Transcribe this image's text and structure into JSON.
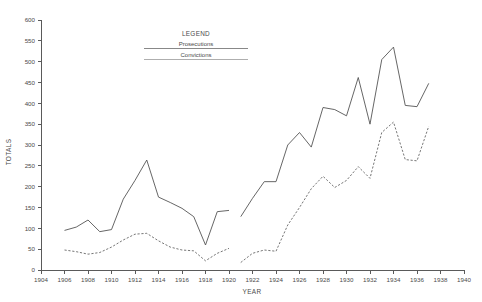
{
  "chart_data": {
    "type": "line",
    "title": "",
    "xlabel": "YEAR",
    "ylabel": "TOTALS",
    "xlim": [
      1904,
      1940
    ],
    "ylim": [
      0,
      600
    ],
    "grid": false,
    "legend_position": "top-center",
    "legend_title": "LEGEND",
    "x_ticks": [
      1904,
      1906,
      1908,
      1910,
      1912,
      1914,
      1916,
      1918,
      1920,
      1922,
      1924,
      1926,
      1928,
      1930,
      1932,
      1934,
      1936,
      1938,
      1940
    ],
    "y_ticks": [
      0,
      50,
      100,
      150,
      200,
      250,
      300,
      350,
      400,
      450,
      500,
      550,
      600
    ],
    "note": "Series are broken between 1920 and 1921 (no data recorded during the gap).",
    "series": [
      {
        "name": "Prosecutions",
        "style": "solid",
        "color": "#555555",
        "segments": [
          {
            "x": [
              1906,
              1907,
              1908,
              1909,
              1910,
              1911,
              1912,
              1913,
              1914,
              1915,
              1916,
              1917,
              1918,
              1919,
              1920
            ],
            "values": [
              95,
              103,
              120,
              92,
              97,
              170,
              215,
              264,
              175,
              162,
              148,
              128,
              60,
              140,
              143
            ]
          },
          {
            "x": [
              1921,
              1922,
              1923,
              1924,
              1925,
              1926,
              1927,
              1928,
              1929,
              1930,
              1931,
              1932,
              1933,
              1934,
              1935,
              1936,
              1937
            ],
            "values": [
              128,
              172,
              212,
              212,
              300,
              330,
              295,
              390,
              385,
              370,
              462,
              350,
              505,
              535,
              395,
              392,
              448
            ]
          }
        ]
      },
      {
        "name": "Convictions",
        "style": "dashed",
        "color": "#666666",
        "segments": [
          {
            "x": [
              1906,
              1907,
              1908,
              1909,
              1910,
              1911,
              1912,
              1913,
              1914,
              1915,
              1916,
              1917,
              1918,
              1919,
              1920
            ],
            "values": [
              48,
              44,
              38,
              42,
              55,
              72,
              86,
              88,
              70,
              55,
              48,
              46,
              22,
              40,
              52
            ]
          },
          {
            "x": [
              1921,
              1922,
              1923,
              1924,
              1925,
              1926,
              1927,
              1928,
              1929,
              1930,
              1931,
              1932,
              1933,
              1934,
              1935,
              1936,
              1937
            ],
            "values": [
              18,
              40,
              48,
              45,
              108,
              150,
              195,
              225,
              198,
              215,
              248,
              220,
              330,
              355,
              265,
              262,
              345
            ]
          }
        ]
      }
    ]
  },
  "legend": {
    "title": "LEGEND",
    "entries": [
      {
        "label": "Prosecutions"
      },
      {
        "label": "Convictions"
      }
    ]
  },
  "axes": {
    "x_title": "YEAR",
    "y_title": "TOTALS"
  },
  "colors": {
    "background": "#ffffff",
    "axis": "#5a5a5a",
    "prosecutions": "#555555",
    "convictions": "#666666",
    "text": "#4a4a4a"
  }
}
